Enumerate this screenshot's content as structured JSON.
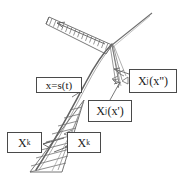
{
  "figure": {
    "background": "#ffffff",
    "ink": "#555555",
    "width": 180,
    "height": 173
  },
  "labels": {
    "shock": {
      "text": "x=s(t)"
    },
    "xk_left": {
      "base": "X",
      "sub": "k"
    },
    "xk_right": {
      "base": "X",
      "sub": "k"
    },
    "xj_prime": {
      "base": "X",
      "sub": "j",
      "arg": "(x')"
    },
    "xj_dprime": {
      "base": "X",
      "sub": "j",
      "arg": "(x\")"
    }
  },
  "elements": {
    "shock_curve": "x=s(t)",
    "upper_hatched_band": "incoming characteristics band (top-left)",
    "lower_hatched_wedge": "outgoing characteristics wedge (bottom)",
    "upper_right_ray": "characteristic ray to upper right",
    "narrow_spike": "narrow characteristic wedge below junction",
    "junction": "shock interaction point"
  }
}
